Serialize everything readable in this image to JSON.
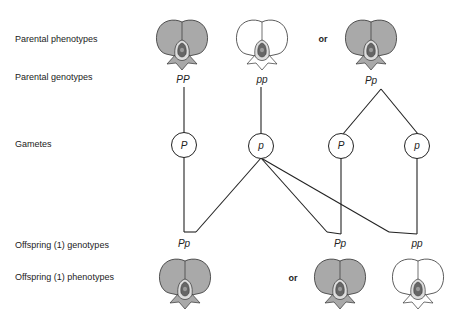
{
  "labels": {
    "parental_phenotypes": "Parental phenotypes",
    "parental_genotypes": "Parental genotypes",
    "gametes": "Gametes",
    "offspring_genotypes": "Offspring (1) genotypes",
    "offspring_phenotypes": "Offspring (1) phenotypes"
  },
  "or_label": "or",
  "parents": [
    {
      "genotype": "PP",
      "phenotype": "purple",
      "x": 183
    },
    {
      "genotype": "pp",
      "phenotype": "white",
      "x": 262
    },
    {
      "genotype": "Pp",
      "phenotype": "purple",
      "x": 371
    }
  ],
  "gametes": [
    {
      "allele": "P",
      "x": 184
    },
    {
      "allele": "p",
      "x": 261
    },
    {
      "allele": "P",
      "x": 341
    },
    {
      "allele": "p",
      "x": 417
    }
  ],
  "offspring": [
    {
      "genotype": "Pp",
      "phenotype": "purple",
      "x": 184
    },
    {
      "genotype": "Pp",
      "phenotype": "purple",
      "x": 340
    },
    {
      "genotype": "pp",
      "phenotype": "white",
      "x": 417
    }
  ],
  "colors": {
    "purple_fill": "#a9a9a9",
    "white_fill": "#ffffff",
    "outline": "#333333",
    "center_dark": "#555555"
  }
}
